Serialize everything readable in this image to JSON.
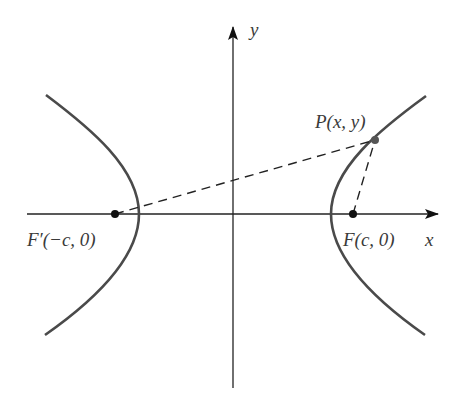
{
  "diagram": {
    "axes": {
      "x_label": "x",
      "y_label": "y"
    },
    "points": {
      "left_focus": {
        "label": "F′(−c, 0)"
      },
      "right_focus": {
        "label": "F(c, 0)"
      },
      "point_p": {
        "label": "P(x, y)"
      }
    },
    "colors": {
      "curve": "#4a4a4a",
      "axis": "#222222",
      "dashed": "#222222",
      "text": "#3a3a3a",
      "background": "#ffffff"
    }
  }
}
